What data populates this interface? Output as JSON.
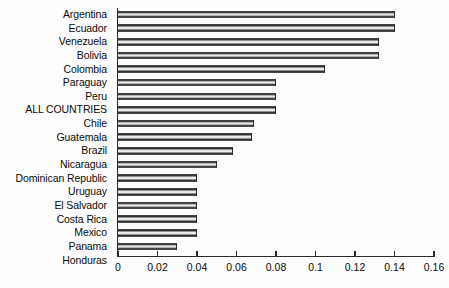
{
  "chart_data": {
    "type": "bar",
    "orientation": "horizontal",
    "title": "",
    "subtitle": "",
    "xlabel": "",
    "ylabel": "",
    "xlim": [
      0,
      0.16
    ],
    "ylim": null,
    "grid": false,
    "legend": null,
    "legend_position": "none",
    "xticks": [
      0,
      0.02,
      0.04,
      0.06,
      0.08,
      0.1,
      0.12,
      0.14,
      0.16
    ],
    "xtick_labels": [
      "0",
      "0.02",
      "0.04",
      "0.06",
      "0.08",
      "0.1",
      "0.12",
      "0.14",
      "0.16"
    ],
    "categories": [
      "Argentina",
      "Ecuador",
      "Venezuela",
      "Bolivia",
      "Colombia",
      "Paraguay",
      "Peru",
      "ALL COUNTRIES",
      "Chile",
      "Guatemala",
      "Brazil",
      "Nicaragua",
      "Dominican Republic",
      "Uruguay",
      "El Salvador",
      "Costa Rica",
      "Mexico",
      "Panama",
      "Honduras"
    ],
    "values": [
      0.14,
      0.14,
      0.132,
      0.132,
      0.105,
      0.08,
      0.08,
      0.08,
      0.069,
      0.068,
      0.058,
      0.05,
      0.04,
      0.04,
      0.04,
      0.04,
      0.04,
      0.03,
      0.0
    ],
    "bar_color": "#2e2e2e",
    "bar_highlight_color": "#ececec",
    "axis_color": "#2b2b2b",
    "background_color": "#ffffff"
  }
}
